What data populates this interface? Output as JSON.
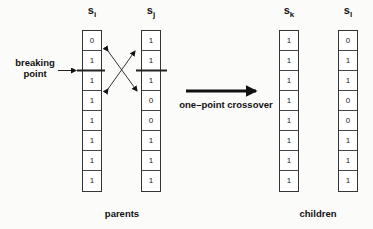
{
  "parents": {
    "label": "parents",
    "si": {
      "name": "s",
      "sub": "i",
      "bits": [
        "0",
        "1",
        "1",
        "1",
        "1",
        "1",
        "1",
        "1"
      ]
    },
    "sj": {
      "name": "s",
      "sub": "j",
      "bits": [
        "1",
        "1",
        "1",
        "0",
        "0",
        "1",
        "1",
        "1"
      ]
    }
  },
  "children": {
    "label": "children",
    "sk": {
      "name": "s",
      "sub": "k",
      "bits": [
        "1",
        "1",
        "1",
        "1",
        "1",
        "1",
        "1",
        "1"
      ]
    },
    "sl": {
      "name": "s",
      "sub": "l",
      "bits": [
        "0",
        "1",
        "1",
        "0",
        "0",
        "1",
        "1",
        "1"
      ]
    }
  },
  "annotations": {
    "breaking_point_line1": "breaking",
    "breaking_point_line2": "point",
    "operation": "one–point crossover"
  }
}
